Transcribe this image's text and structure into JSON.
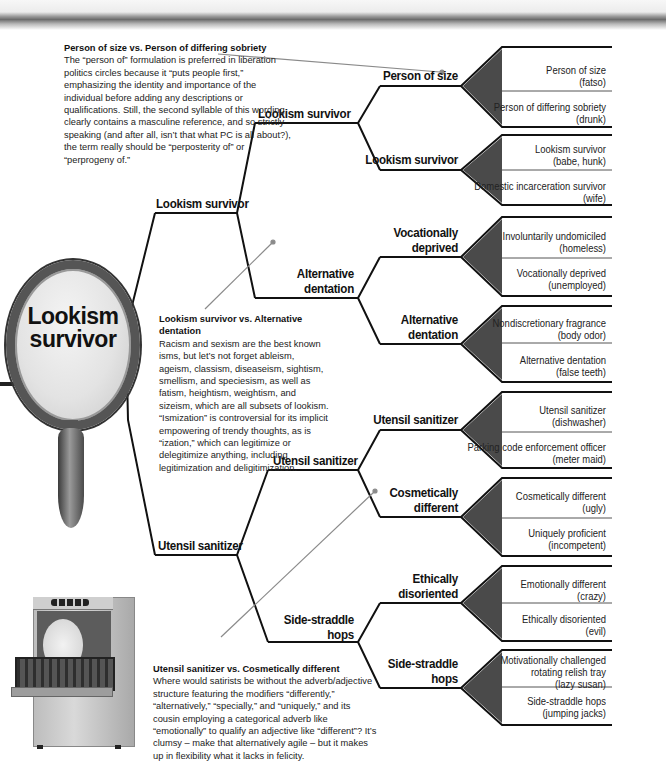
{
  "colors": {
    "line": "#111111",
    "wedge": "#4a4a4a",
    "pointer": "#8a8a8a",
    "text": "#1a1a1a"
  },
  "champion": {
    "label": "Lookism survivor",
    "line1": "Lookism",
    "line2": "survivor",
    "image": "hand-mirror-icon"
  },
  "round4": [
    {
      "label": "Lookism survivor"
    },
    {
      "label": "Utensil sanitizer"
    }
  ],
  "round3": [
    {
      "label": "Lookism survivor"
    },
    {
      "label": "Alternative dentation",
      "line1": "Alternative",
      "line2": "dentation"
    },
    {
      "label": "Utensil sanitizer"
    },
    {
      "label": "Side-straddle hops",
      "line1": "Side-straddle",
      "line2": "hops"
    }
  ],
  "round2": [
    {
      "label": "Person of size"
    },
    {
      "label": "Lookism survivor"
    },
    {
      "label": "Vocationally deprived",
      "line1": "Vocationally",
      "line2": "deprived"
    },
    {
      "label": "Alternative dentation",
      "line1": "Alternative",
      "line2": "dentation"
    },
    {
      "label": "Utensil sanitizer"
    },
    {
      "label": "Cosmetically different",
      "line1": "Cosmetically",
      "line2": "different"
    },
    {
      "label": "Ethically disoriented",
      "line1": "Ethically",
      "line2": "disoriented"
    },
    {
      "label": "Side-straddle hops",
      "line1": "Side-straddle",
      "line2": "hops"
    }
  ],
  "round1": [
    {
      "term": "Person of size",
      "meaning": "(fatso)"
    },
    {
      "term": "Person of differing sobriety",
      "meaning": "(drunk)"
    },
    {
      "term": "Lookism survivor",
      "meaning": "(babe, hunk)"
    },
    {
      "term": "Domestic incarceration survivor",
      "meaning": "(wife)"
    },
    {
      "term": "Involuntarily undomiciled",
      "meaning": "(homeless)"
    },
    {
      "term": "Vocationally deprived",
      "meaning": "(unemployed)"
    },
    {
      "term": "Nondiscretionary fragrance",
      "meaning": "(body odor)"
    },
    {
      "term": "Alternative dentation",
      "meaning": "(false teeth)"
    },
    {
      "term": "Utensil sanitizer",
      "meaning": "(dishwasher)"
    },
    {
      "term": "Parking code enforcement officer",
      "meaning": "(meter maid)"
    },
    {
      "term": "Cosmetically different",
      "meaning": "(ugly)"
    },
    {
      "term": "Uniquely proficient",
      "meaning": "(incompetent)"
    },
    {
      "term": "Emotionally different",
      "meaning": "(crazy)"
    },
    {
      "term": "Ethically disoriented",
      "meaning": "(evil)"
    },
    {
      "term": "Motivationally challenged rotating relish tray",
      "term_line1": "Motivationally challenged",
      "term_line2": "rotating relish tray",
      "meaning": "(lazy susan)"
    },
    {
      "term": "Side-straddle hops",
      "meaning": "(jumping jacks)"
    }
  ],
  "notes": [
    {
      "title": "Person of size vs. Person of differing sobriety",
      "body": "The “person of” formulation is preferred in liberation politics circles because it “puts people first,” emphasizing the identity and importance of the individual before adding any descriptions or qualifications. Still, the second syllable of this wording clearly contains a masculine reference, and so strictly speaking (and after all, isn’t that what PC is all about?), the term really should be “perposterity of” or “perprogeny of.”"
    },
    {
      "title": "Lookism survivor vs. Alternative dentation",
      "body": "Racism and sexism are the best known isms, but let’s not forget ableism, ageism, classism, diseaseism, sightism, smellism, and speciesism, as well as fatism, heightism, weightism, and sizeism, which are all subsets of lookism. “Ismization” is controversial for its implicit empowering of trendy thoughts, as is “ization,” which can legitimize or delegitimize anything, including legitimization and deligitimization."
    },
    {
      "title": "Utensil sanitizer vs. Cosmetically different",
      "body": "Where would satirists be without the adverb/adjective structure featuring the modifiers “differently,” “alternatively,” “specially,” and “uniquely,” and its cousin employing a categorical adverb like “emotionally” to qualify an adjective like “different”? It’s clumsy – make that alternatively agile – but it makes up in flexibility what it lacks in felicity."
    }
  ],
  "images": {
    "mirror": "hand-mirror-icon",
    "dishwasher": "dishwasher-icon"
  }
}
